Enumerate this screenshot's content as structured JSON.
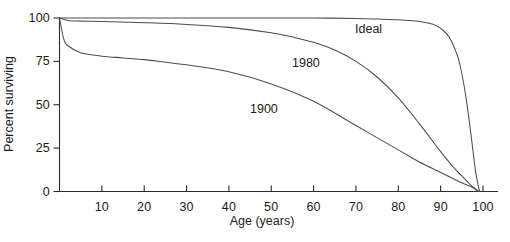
{
  "chart_data": {
    "type": "line",
    "title": "",
    "xlabel": "Age (years)",
    "ylabel": "Percent surviving",
    "xlim": [
      0,
      103
    ],
    "ylim": [
      0,
      100
    ],
    "grid": false,
    "legend": "inline-annotations",
    "xticks": [
      0,
      10,
      20,
      30,
      40,
      50,
      60,
      70,
      80,
      90,
      100
    ],
    "xtick_labels": [
      "0",
      "10",
      "20",
      "30",
      "40",
      "50",
      "60",
      "70",
      "80",
      "90",
      "100"
    ],
    "yticks": [
      0,
      25,
      50,
      75,
      100
    ],
    "ytick_labels": [
      "0",
      "25",
      "50",
      "75",
      "100"
    ],
    "series": [
      {
        "name": "Ideal",
        "color": "#4d4d4d",
        "label_text": "Ideal",
        "x": [
          0,
          10,
          20,
          30,
          40,
          50,
          60,
          70,
          75,
          80,
          85,
          88,
          90,
          92,
          94,
          95,
          96,
          97,
          98,
          98.5,
          99,
          99.3
        ],
        "values": [
          100,
          100,
          100,
          100,
          100,
          100,
          100,
          99.7,
          99.4,
          99,
          98,
          96.5,
          94,
          89,
          78,
          68,
          54,
          36,
          16,
          8,
          2,
          0
        ]
      },
      {
        "name": "1980",
        "color": "#4d4d4d",
        "label_text": "1980",
        "x": [
          0,
          2,
          5,
          10,
          20,
          30,
          40,
          50,
          55,
          60,
          65,
          70,
          75,
          80,
          85,
          90,
          93,
          95,
          97,
          98,
          99
        ],
        "values": [
          100,
          98.6,
          98.2,
          98,
          97.3,
          96.3,
          94.6,
          91.5,
          89,
          86,
          81.5,
          75,
          66,
          54,
          39,
          23,
          14,
          9,
          4,
          2,
          0
        ]
      },
      {
        "name": "1900",
        "color": "#4d4d4d",
        "label_text": "1900",
        "x": [
          0,
          1,
          2,
          5,
          10,
          15,
          20,
          25,
          30,
          40,
          50,
          60,
          70,
          80,
          85,
          90,
          95,
          97,
          99
        ],
        "values": [
          100,
          88,
          84,
          80,
          78,
          77,
          76,
          74.5,
          73,
          69,
          62,
          52,
          38,
          24,
          17,
          11,
          5,
          3,
          0
        ]
      }
    ]
  },
  "axis": {
    "x_title": "Age (years)",
    "y_title": "Percent surviving"
  }
}
